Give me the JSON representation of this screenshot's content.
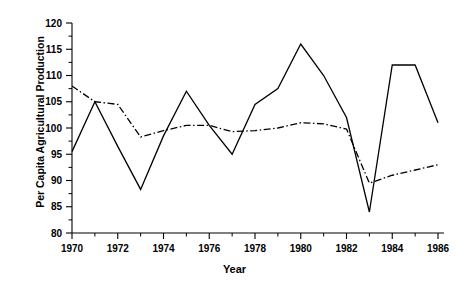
{
  "chart_data": {
    "type": "line",
    "title": "",
    "xlabel": "Year",
    "ylabel": "Per Capita Agricultural Production",
    "xlim": [
      1970,
      1986
    ],
    "ylim": [
      80,
      120
    ],
    "ytick_step": 5,
    "xtick_step": 2,
    "x_minor_tick_step": 1,
    "grid": false,
    "legend": "none",
    "x": [
      1970,
      1971,
      1972,
      1973,
      1974,
      1975,
      1976,
      1977,
      1978,
      1979,
      1980,
      1981,
      1982,
      1983,
      1984,
      1985,
      1986
    ],
    "xticks": [
      "1970",
      "1972",
      "1974",
      "1976",
      "1978",
      "1980",
      "1982",
      "1984",
      "1986"
    ],
    "yticks": [
      "80",
      "85",
      "90",
      "95",
      "100",
      "105",
      "110",
      "115",
      "120"
    ],
    "series": [
      {
        "name": "solid-series",
        "style": "solid",
        "color": "#000000",
        "values": [
          95.5,
          105.0,
          96.5,
          88.3,
          98.5,
          107.0,
          100.5,
          95.0,
          104.5,
          107.5,
          116.0,
          110.0,
          102.0,
          84.0,
          112.0,
          112.0,
          101.0
        ]
      },
      {
        "name": "dash-dot-series",
        "style": "dash-dot",
        "color": "#000000",
        "values": [
          108.0,
          105.0,
          104.5,
          98.3,
          99.5,
          100.5,
          100.5,
          99.3,
          99.5,
          100.0,
          101.0,
          100.8,
          99.8,
          89.5,
          91.0,
          92.0,
          93.0
        ]
      }
    ]
  },
  "axis": {
    "x_title": "Year",
    "y_title": "Per Capita Agricultural Production"
  }
}
